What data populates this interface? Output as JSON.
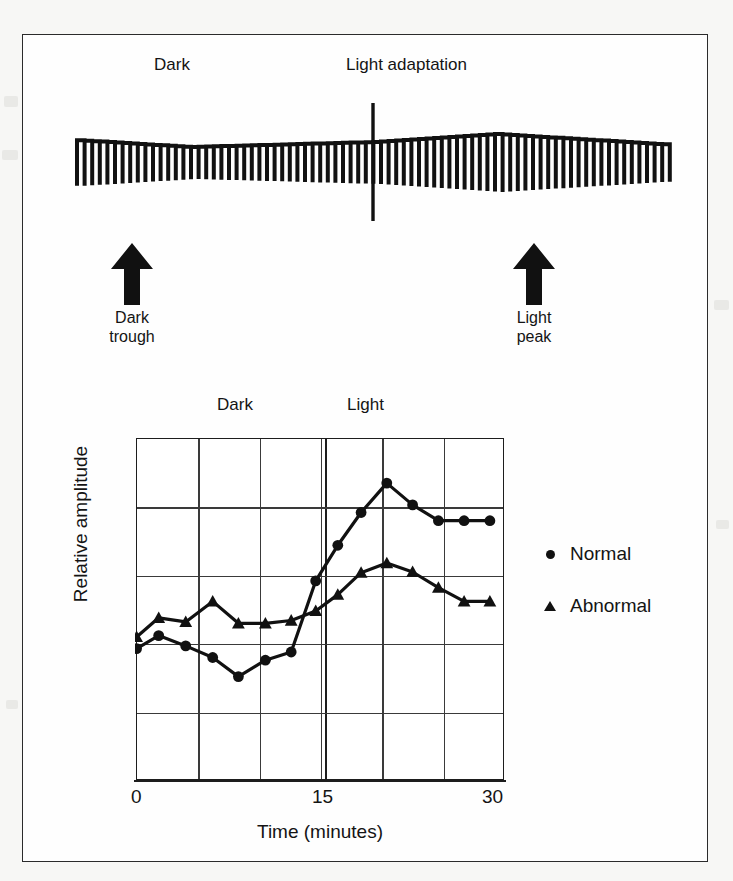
{
  "figure": {
    "top_panel": {
      "phase_labels": [
        {
          "id": "dark",
          "text": "Dark"
        },
        {
          "id": "light_adaptation",
          "text": "Light adaptation"
        }
      ],
      "annotations": [
        {
          "id": "dark-trough",
          "line1": "Dark",
          "line2": "trough",
          "arrow": "up-arrow-icon"
        },
        {
          "id": "light-peak",
          "line1": "Light",
          "line2": "peak",
          "arrow": "up-arrow-icon"
        }
      ],
      "waveform": {
        "description": "EOG square-wave saccade recording",
        "color": "#111111"
      }
    },
    "chart_panel": {
      "segment_labels": [
        {
          "id": "dark",
          "text": "Dark"
        },
        {
          "id": "light",
          "text": "Light"
        }
      ]
    }
  },
  "chart_data": {
    "type": "line",
    "title": "",
    "xlabel": "Time (minutes)",
    "ylabel": "Relative amplitude",
    "xlim": [
      0,
      30
    ],
    "ylim": [
      0,
      5
    ],
    "xticks": [
      0,
      15,
      30
    ],
    "xtick_labels": [
      "0",
      "15",
      "30"
    ],
    "yticks": [],
    "ytick_labels": [],
    "grid": true,
    "grid_x_interval": 5,
    "grid_y_interval": 1,
    "legend_position": "right",
    "annotations": [
      {
        "text": "Dark",
        "x": 7.5,
        "position": "above-axis"
      },
      {
        "text": "Light",
        "x": 22.5,
        "position": "above-axis"
      },
      {
        "text": "light-onset-divider",
        "x": 15,
        "position": "vertical-double-line"
      }
    ],
    "x": [
      0,
      1.8,
      4.0,
      6.2,
      8.3,
      10.5,
      12.6,
      14.6,
      16.4,
      18.3,
      20.4,
      22.5,
      24.6,
      26.7,
      28.8
    ],
    "series": [
      {
        "name": "Normal",
        "marker": "circle",
        "color": "#111111",
        "values": [
          1.93,
          2.12,
          1.97,
          1.8,
          1.52,
          1.76,
          1.88,
          2.92,
          3.44,
          3.92,
          4.35,
          4.03,
          3.8,
          3.8,
          3.8
        ]
      },
      {
        "name": "Abnormal",
        "marker": "triangle",
        "color": "#111111",
        "values": [
          2.1,
          2.38,
          2.32,
          2.62,
          2.3,
          2.3,
          2.34,
          2.48,
          2.72,
          3.04,
          3.18,
          3.05,
          2.82,
          2.62,
          2.62
        ]
      }
    ],
    "legend": [
      {
        "label": "Normal",
        "marker": "circle"
      },
      {
        "label": "Abnormal",
        "marker": "triangle"
      }
    ]
  }
}
